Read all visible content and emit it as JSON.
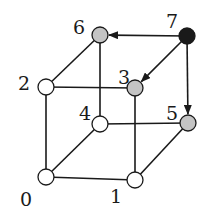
{
  "diagram": {
    "type": "hypercube-3d",
    "colors": {
      "white": "#ffffff",
      "gray": "#c4c4c4",
      "black": "#1a1a1a",
      "stroke": "#1a1a1a"
    },
    "nodes": [
      {
        "id": "0",
        "label": "0",
        "x": 46,
        "y": 177,
        "fill": "white",
        "lx": 20,
        "ly": 206
      },
      {
        "id": "1",
        "label": "1",
        "x": 135,
        "y": 180,
        "fill": "white",
        "lx": 110,
        "ly": 203
      },
      {
        "id": "2",
        "label": "2",
        "x": 46,
        "y": 87,
        "fill": "white",
        "lx": 18,
        "ly": 90
      },
      {
        "id": "3",
        "label": "3",
        "x": 135,
        "y": 88,
        "fill": "gray",
        "lx": 118,
        "ly": 84
      },
      {
        "id": "4",
        "label": "4",
        "x": 100,
        "y": 124,
        "fill": "white",
        "lx": 79,
        "ly": 120
      },
      {
        "id": "5",
        "label": "5",
        "x": 188,
        "y": 123,
        "fill": "gray",
        "lx": 166,
        "ly": 120
      },
      {
        "id": "6",
        "label": "6",
        "x": 100,
        "y": 35,
        "fill": "gray",
        "lx": 73,
        "ly": 34
      },
      {
        "id": "7",
        "label": "7",
        "x": 187,
        "y": 36,
        "fill": "black",
        "lx": 166,
        "ly": 28
      }
    ],
    "edges": [
      {
        "from": "0",
        "to": "1",
        "directed": false
      },
      {
        "from": "0",
        "to": "2",
        "directed": false
      },
      {
        "from": "0",
        "to": "4",
        "directed": false
      },
      {
        "from": "1",
        "to": "3",
        "directed": false
      },
      {
        "from": "1",
        "to": "5",
        "directed": false
      },
      {
        "from": "2",
        "to": "3",
        "directed": false
      },
      {
        "from": "2",
        "to": "6",
        "directed": false
      },
      {
        "from": "4",
        "to": "5",
        "directed": false
      },
      {
        "from": "4",
        "to": "6",
        "directed": false
      },
      {
        "from": "7",
        "to": "6",
        "directed": true
      },
      {
        "from": "7",
        "to": "3",
        "directed": true
      },
      {
        "from": "7",
        "to": "5",
        "directed": true
      }
    ]
  }
}
